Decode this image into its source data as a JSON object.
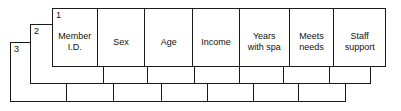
{
  "diagram": {
    "line_color": "#1a1a1a",
    "background_color": "#ffffff",
    "sheets": [
      {
        "number": "3",
        "position": "back",
        "columns": [
          "",
          "",
          "",
          "",
          "",
          "",
          ""
        ]
      },
      {
        "number": "2",
        "position": "middle",
        "columns": [
          "",
          "",
          "",
          "",
          "",
          "",
          ""
        ]
      },
      {
        "number": "1",
        "position": "front",
        "columns": [
          "Member\nI.D.",
          "Sex",
          "Age",
          "Income",
          "Years\nwith spa",
          "Meets\nneeds",
          "Staff\nsupport"
        ]
      }
    ]
  }
}
